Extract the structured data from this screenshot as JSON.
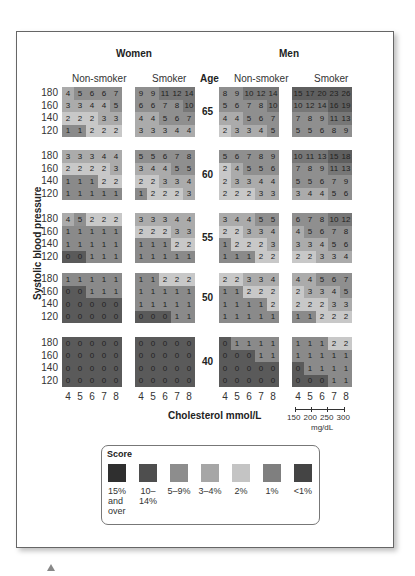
{
  "chart_data": {
    "type": "heatmap",
    "title": "",
    "ylabel": "Systolic blood pressure",
    "xlabel": "Cholesterol mmol/L",
    "x_secondary_label": "mg/dL",
    "x_secondary_ticks": [
      "150",
      "200",
      "250",
      "300"
    ],
    "x_ticks": [
      "4",
      "5",
      "6",
      "7",
      "8"
    ],
    "y_ticks": [
      "180",
      "160",
      "140",
      "120"
    ],
    "groups": [
      "Women",
      "Men"
    ],
    "subgroups": [
      "Non-smoker",
      "Smoker"
    ],
    "age_label": "Age",
    "ages": [
      "65",
      "60",
      "55",
      "50",
      "40"
    ],
    "values": {
      "65": {
        "women_nonsmoker": [
          [
            4,
            5,
            6,
            6,
            7
          ],
          [
            3,
            3,
            4,
            4,
            5
          ],
          [
            2,
            2,
            2,
            3,
            3
          ],
          [
            1,
            1,
            2,
            2,
            2
          ]
        ],
        "women_smoker": [
          [
            9,
            9,
            11,
            12,
            14
          ],
          [
            6,
            6,
            7,
            8,
            10
          ],
          [
            4,
            4,
            5,
            6,
            7
          ],
          [
            3,
            3,
            3,
            4,
            4
          ]
        ],
        "men_nonsmoker": [
          [
            8,
            9,
            10,
            12,
            14
          ],
          [
            5,
            6,
            7,
            8,
            10
          ],
          [
            4,
            4,
            5,
            6,
            7
          ],
          [
            2,
            3,
            3,
            4,
            5
          ]
        ],
        "men_smoker": [
          [
            15,
            17,
            20,
            23,
            26
          ],
          [
            10,
            12,
            14,
            16,
            19
          ],
          [
            7,
            8,
            9,
            11,
            13
          ],
          [
            5,
            5,
            6,
            8,
            9
          ]
        ]
      },
      "60": {
        "women_nonsmoker": [
          [
            3,
            3,
            3,
            4,
            4
          ],
          [
            2,
            2,
            2,
            2,
            3
          ],
          [
            1,
            1,
            1,
            2,
            2
          ],
          [
            1,
            1,
            1,
            1,
            1
          ]
        ],
        "women_smoker": [
          [
            5,
            5,
            6,
            7,
            8
          ],
          [
            3,
            4,
            4,
            5,
            5
          ],
          [
            2,
            2,
            3,
            3,
            4
          ],
          [
            1,
            2,
            2,
            2,
            3
          ]
        ],
        "men_nonsmoker": [
          [
            5,
            6,
            7,
            8,
            9
          ],
          [
            2,
            4,
            5,
            5,
            6
          ],
          [
            2,
            3,
            3,
            4,
            4
          ],
          [
            2,
            2,
            2,
            3,
            3
          ]
        ],
        "men_smoker": [
          [
            10,
            11,
            13,
            15,
            18
          ],
          [
            7,
            8,
            9,
            11,
            13
          ],
          [
            5,
            5,
            6,
            7,
            9
          ],
          [
            3,
            4,
            4,
            5,
            6
          ]
        ]
      },
      "55": {
        "women_nonsmoker": [
          [
            4,
            5,
            2,
            2,
            2
          ],
          [
            1,
            1,
            1,
            1,
            1
          ],
          [
            1,
            1,
            1,
            1,
            1
          ],
          [
            0,
            0,
            1,
            1,
            1
          ]
        ],
        "women_smoker": [
          [
            3,
            3,
            3,
            4,
            4
          ],
          [
            2,
            2,
            2,
            3,
            3
          ],
          [
            1,
            1,
            1,
            2,
            2
          ],
          [
            1,
            1,
            1,
            1,
            1
          ]
        ],
        "men_nonsmoker": [
          [
            3,
            4,
            4,
            5,
            5
          ],
          [
            2,
            2,
            3,
            3,
            4
          ],
          [
            1,
            2,
            2,
            2,
            3
          ],
          [
            1,
            1,
            1,
            2,
            2
          ]
        ],
        "men_smoker": [
          [
            6,
            7,
            8,
            10,
            12
          ],
          [
            4,
            5,
            6,
            7,
            8
          ],
          [
            3,
            3,
            4,
            5,
            6
          ],
          [
            2,
            2,
            3,
            3,
            4
          ]
        ]
      },
      "50": {
        "women_nonsmoker": [
          [
            1,
            1,
            1,
            1,
            1
          ],
          [
            0,
            0,
            1,
            1,
            1
          ],
          [
            0,
            0,
            0,
            0,
            0
          ],
          [
            0,
            0,
            0,
            0,
            0
          ]
        ],
        "women_smoker": [
          [
            1,
            1,
            2,
            2,
            2
          ],
          [
            1,
            1,
            1,
            1,
            1
          ],
          [
            1,
            1,
            1,
            1,
            1
          ],
          [
            0,
            0,
            0,
            1,
            1
          ]
        ],
        "men_nonsmoker": [
          [
            2,
            2,
            3,
            3,
            4
          ],
          [
            1,
            1,
            2,
            2,
            2
          ],
          [
            1,
            1,
            1,
            1,
            2
          ],
          [
            1,
            1,
            1,
            1,
            1
          ]
        ],
        "men_smoker": [
          [
            4,
            4,
            5,
            6,
            7
          ],
          [
            2,
            3,
            3,
            4,
            5
          ],
          [
            2,
            2,
            2,
            3,
            3
          ],
          [
            1,
            1,
            2,
            2,
            2
          ]
        ]
      },
      "40": {
        "women_nonsmoker": [
          [
            0,
            0,
            0,
            0,
            0
          ],
          [
            0,
            0,
            0,
            0,
            0
          ],
          [
            0,
            0,
            0,
            0,
            0
          ],
          [
            0,
            0,
            0,
            0,
            0
          ]
        ],
        "women_smoker": [
          [
            0,
            0,
            0,
            0,
            0
          ],
          [
            0,
            0,
            0,
            0,
            0
          ],
          [
            0,
            0,
            0,
            0,
            0
          ],
          [
            0,
            0,
            0,
            0,
            0
          ]
        ],
        "men_nonsmoker": [
          [
            0,
            1,
            1,
            1,
            1
          ],
          [
            0,
            0,
            0,
            1,
            1
          ],
          [
            0,
            0,
            0,
            0,
            0
          ],
          [
            0,
            0,
            0,
            0,
            0
          ]
        ],
        "men_smoker": [
          [
            1,
            1,
            1,
            2,
            2
          ],
          [
            1,
            1,
            1,
            1,
            1
          ],
          [
            0,
            1,
            1,
            1,
            1
          ],
          [
            0,
            0,
            0,
            1,
            1
          ]
        ]
      }
    },
    "legend": {
      "title": "Score",
      "entries": [
        {
          "label": "15% and over",
          "color": "#2f2f2f"
        },
        {
          "label": "10–14%",
          "color": "#4e4e4e"
        },
        {
          "label": "5–9%",
          "color": "#8d8d8d"
        },
        {
          "label": "3–4%",
          "color": "#a6a6a6"
        },
        {
          "label": "2%",
          "color": "#c4c4c4"
        },
        {
          "label": "1%",
          "color": "#7f7f7f"
        },
        {
          "label": "<1%",
          "color": "#444444"
        }
      ]
    }
  },
  "labels": {
    "women": "Women",
    "men": "Men",
    "nonsmoker": "Non-smoker",
    "smoker": "Smoker",
    "age": "Age",
    "ylabel": "Systolic blood pressure",
    "xlabel": "Cholesterol mmol/L",
    "mgdl": "mg/dL",
    "legend_title": "Score"
  }
}
